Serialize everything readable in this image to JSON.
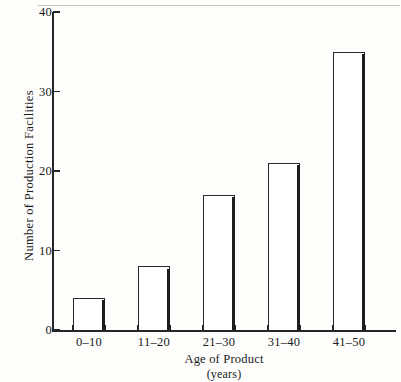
{
  "chart_data": {
    "type": "bar",
    "title": "",
    "subtitle": "",
    "xlabel": "Age of Product",
    "xlabel_unit": "(years)",
    "ylabel": "Number of Production Facilities",
    "categories": [
      "0–10",
      "11–20",
      "21–30",
      "31–40",
      "41–50"
    ],
    "values": [
      4,
      8,
      17,
      21,
      35
    ],
    "ylim": [
      0,
      40
    ],
    "yticks": [
      0,
      10,
      20,
      30,
      40
    ],
    "ytick_labels": [
      "0",
      "10",
      "20",
      "30",
      "40"
    ],
    "grid": false,
    "legend": false,
    "legend_position": "none",
    "bar_style": "outlined",
    "colors": {
      "bar_fill": "#ffffff",
      "bar_stroke": "#2a2a2a",
      "bar_shadow": "#1d1d1d",
      "axis": "#262626",
      "text": "#1a1a1a",
      "background": "#fdfdfb"
    }
  }
}
